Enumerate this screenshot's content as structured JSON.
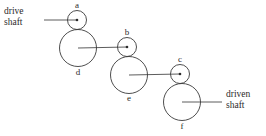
{
  "diagram": {
    "background_color": "#ffffff",
    "stroke_color": "#3a3a3a",
    "shaft_color": "#4a4a4a",
    "text_color": "#2b2b2b",
    "annotations": {
      "drive_line1": "drive",
      "drive_line2": "shaft",
      "driven_line1": "driven",
      "driven_line2": "shaft"
    },
    "gears": [
      {
        "id": "gear-a",
        "label": "a",
        "size": "small",
        "cx": 77,
        "cy": 20,
        "r": 9.5,
        "label_x": 77,
        "label_y": 6,
        "label_anchor": "middle"
      },
      {
        "id": "gear-d",
        "label": "d",
        "size": "large",
        "cx": 78,
        "cy": 48,
        "r": 18.5,
        "label_x": 78,
        "label_y": 73,
        "label_anchor": "middle"
      },
      {
        "id": "gear-b",
        "label": "b",
        "size": "small",
        "cx": 127,
        "cy": 47,
        "r": 9.5,
        "label_x": 127,
        "label_y": 33,
        "label_anchor": "middle"
      },
      {
        "id": "gear-e",
        "label": "e",
        "size": "large",
        "cx": 129,
        "cy": 75,
        "r": 18.5,
        "label_x": 129,
        "label_y": 99,
        "label_anchor": "middle"
      },
      {
        "id": "gear-c",
        "label": "c",
        "size": "small",
        "cx": 180,
        "cy": 74,
        "r": 9.5,
        "label_x": 180,
        "label_y": 60,
        "label_anchor": "middle"
      },
      {
        "id": "gear-f",
        "label": "f",
        "size": "large",
        "cx": 182,
        "cy": 102,
        "r": 18.5,
        "label_x": 182,
        "label_y": 127,
        "label_anchor": "middle"
      }
    ],
    "shafts": [
      {
        "id": "drive-shaft-line",
        "x1": 44,
        "y1": 20,
        "x2": 77,
        "y2": 20
      },
      {
        "id": "shaft-d-to-b",
        "x1": 78,
        "y1": 48,
        "x2": 127,
        "y2": 47
      },
      {
        "id": "shaft-e-to-c",
        "x1": 129,
        "y1": 75,
        "x2": 180,
        "y2": 74
      },
      {
        "id": "driven-shaft-line",
        "x1": 182,
        "y1": 102,
        "x2": 222,
        "y2": 102
      }
    ],
    "caption_positions": {
      "drive_x": 4,
      "drive_y1": 12,
      "drive_y2": 23,
      "driven_x": 226,
      "driven_y1": 95,
      "driven_y2": 106
    }
  }
}
